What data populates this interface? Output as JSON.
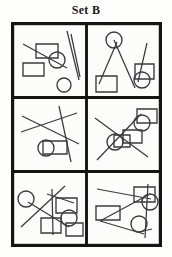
{
  "figure": {
    "title": "Set B",
    "kind": "shape-puzzle-grid",
    "grid": {
      "rows": 3,
      "cols": 2,
      "cell_count": 6
    },
    "colors": {
      "background": "#fdfdfc",
      "frame": "#141414",
      "shape_stroke": "#3a3a40",
      "title_text": "#1a1a1a"
    },
    "cells": [
      {
        "id": "cell-1",
        "position": "top-left",
        "contents": "two squares, two circles, two long diagonal lines",
        "counts": {
          "squares": 2,
          "circles": 2,
          "lines": 2
        }
      },
      {
        "id": "cell-2",
        "position": "top-right",
        "contents": "two squares, two circles, three lines forming a narrow X",
        "counts": {
          "squares": 2,
          "circles": 2,
          "lines": 3
        }
      },
      {
        "id": "cell-3",
        "position": "middle-left",
        "contents": "one square, one ellipse, three crossing lines",
        "counts": {
          "squares": 1,
          "circles": 1,
          "lines": 3
        }
      },
      {
        "id": "cell-4",
        "position": "middle-right",
        "contents": "three squares, two circles, two crossing diagonal lines",
        "counts": {
          "squares": 3,
          "circles": 2,
          "lines": 2
        }
      },
      {
        "id": "cell-5",
        "position": "bottom-left",
        "contents": "three squares, two circles, four crossing lines",
        "counts": {
          "squares": 3,
          "circles": 2,
          "lines": 4
        }
      },
      {
        "id": "cell-6",
        "position": "bottom-right",
        "contents": "two squares, two circles, four lines",
        "counts": {
          "squares": 2,
          "circles": 2,
          "lines": 4
        }
      }
    ]
  }
}
